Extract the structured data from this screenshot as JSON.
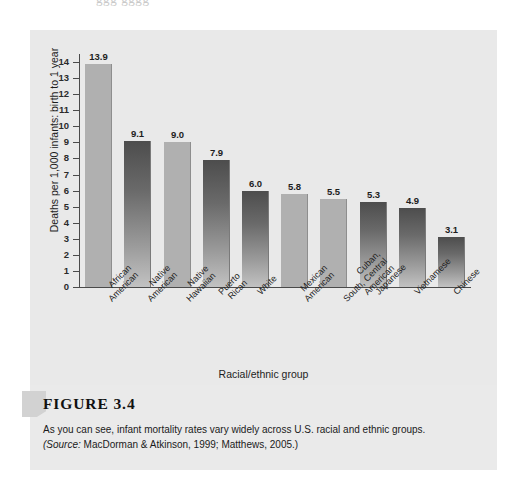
{
  "ghost_top_text": "ggg gggg",
  "chart_data": {
    "type": "bar",
    "title": "",
    "xlabel": "Racial/ethnic group",
    "ylabel": "Deaths per 1,000 infants: birth to 1 year",
    "ylim": [
      0,
      14
    ],
    "ytick_labels": [
      "14",
      "13",
      "12",
      "11",
      "10",
      "9",
      "8",
      "7",
      "6",
      "5",
      "4",
      "3",
      "2",
      "1",
      "0"
    ],
    "ytick_values": [
      14,
      13,
      12,
      11,
      10,
      9,
      8,
      7,
      6,
      5,
      4,
      3,
      2,
      1,
      0
    ],
    "grid": false,
    "legend": "none",
    "categories": [
      "African American",
      "Native American",
      "Native Hawaiian",
      "Puerto Rican",
      "White",
      "Mexican American",
      "Cuban, South, Central American",
      "Japanese",
      "Vietnamese",
      "Chinese"
    ],
    "category_label_lines": [
      [
        "African",
        "American"
      ],
      [
        "Native",
        "American"
      ],
      [
        "Native",
        "Hawaiian"
      ],
      [
        "Puerto",
        "Rican"
      ],
      [
        "White"
      ],
      [
        "Mexican",
        "American"
      ],
      [
        "Cuban,",
        "South, Central",
        "American"
      ],
      [
        "Japanese"
      ],
      [
        "Vietnamese"
      ],
      [
        "Chinese"
      ]
    ],
    "values": [
      13.9,
      9.1,
      9.0,
      7.9,
      6.0,
      5.8,
      5.5,
      5.3,
      4.9,
      3.1
    ],
    "value_labels": [
      "13.9",
      "9.1",
      "9.0",
      "7.9",
      "6.0",
      "5.8",
      "5.5",
      "5.3",
      "4.9",
      "3.1"
    ],
    "bar_styles": [
      "light",
      "dark",
      "light",
      "dark",
      "dark",
      "light",
      "light",
      "dark",
      "dark",
      "dark"
    ],
    "colors": {
      "bar_light": "#b0b0b0",
      "bar_dark_top": "#4d4d4d",
      "bar_dark_bottom": "#c2c2c2",
      "panel_background": "#e9e9e9",
      "axis": "#4a4a4a",
      "text": "#1d1d1d"
    }
  },
  "caption": {
    "figure_label": "FIGURE 3.4",
    "description": "As you can see, infant mortality rates vary widely across U.S. racial and ethnic groups.",
    "source_prefix": "(Source:",
    "source_rest": " MacDorman & Atkinson, 1999; Matthews, 2005.)"
  }
}
